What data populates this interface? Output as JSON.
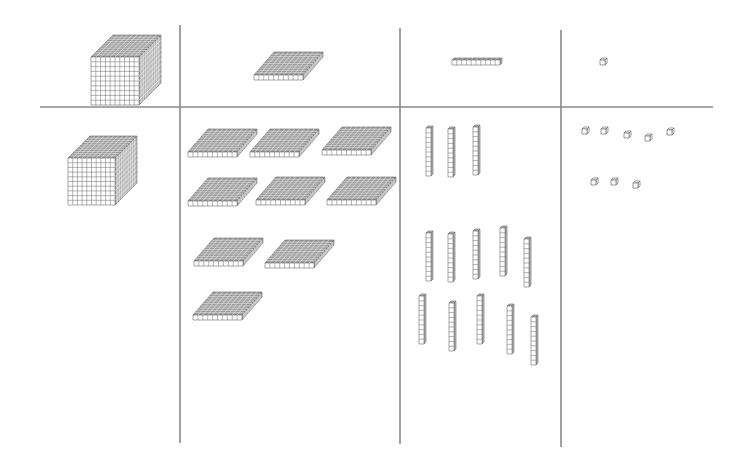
{
  "colors": {
    "line": "#8a8a8a",
    "block_stroke": "#6b6b6b",
    "block_fill": "#ffffff",
    "top_fill": "#9a9a9a",
    "side_fill": "#b5b5b5"
  },
  "columns": [
    {
      "name": "thousands",
      "header_block": "cube",
      "count": 1
    },
    {
      "name": "hundreds",
      "header_block": "flat",
      "count": 9
    },
    {
      "name": "tens",
      "header_block": "rod",
      "count": 13
    },
    {
      "name": "ones",
      "header_block": "unit",
      "count": 8
    }
  ],
  "grid": {
    "horizontal": {
      "x1": 40,
      "x2": 713,
      "y": 107
    },
    "verticals": [
      {
        "x": 180,
        "y1": 25,
        "y2": 443
      },
      {
        "x": 400,
        "y1": 28,
        "y2": 444
      },
      {
        "x": 561,
        "y1": 30,
        "y2": 447
      }
    ]
  },
  "header_blocks": {
    "cube": {
      "x": 91,
      "y": 57
    },
    "flat": {
      "x": 254,
      "y": 80
    },
    "rod": {
      "x": 452,
      "y": 58
    },
    "unit": {
      "x": 600,
      "y": 58
    }
  },
  "cubes": [
    {
      "x": 68,
      "y": 158
    }
  ],
  "flats": [
    {
      "x": 188,
      "y": 157
    },
    {
      "x": 250,
      "y": 157
    },
    {
      "x": 322,
      "y": 155
    },
    {
      "x": 188,
      "y": 206
    },
    {
      "x": 256,
      "y": 205
    },
    {
      "x": 327,
      "y": 205
    },
    {
      "x": 194,
      "y": 266
    },
    {
      "x": 265,
      "y": 268
    },
    {
      "x": 193,
      "y": 320
    }
  ],
  "rods": [
    {
      "x": 426,
      "y": 126
    },
    {
      "x": 448,
      "y": 127
    },
    {
      "x": 473,
      "y": 125
    },
    {
      "x": 426,
      "y": 231
    },
    {
      "x": 448,
      "y": 232
    },
    {
      "x": 473,
      "y": 229
    },
    {
      "x": 500,
      "y": 226
    },
    {
      "x": 524,
      "y": 237
    },
    {
      "x": 419,
      "y": 294
    },
    {
      "x": 449,
      "y": 301
    },
    {
      "x": 477,
      "y": 294
    },
    {
      "x": 507,
      "y": 304
    },
    {
      "x": 531,
      "y": 315
    }
  ],
  "units": [
    {
      "x": 582,
      "y": 127
    },
    {
      "x": 601,
      "y": 127
    },
    {
      "x": 624,
      "y": 131
    },
    {
      "x": 645,
      "y": 134
    },
    {
      "x": 667,
      "y": 128
    },
    {
      "x": 591,
      "y": 178
    },
    {
      "x": 611,
      "y": 178
    },
    {
      "x": 633,
      "y": 181
    }
  ]
}
